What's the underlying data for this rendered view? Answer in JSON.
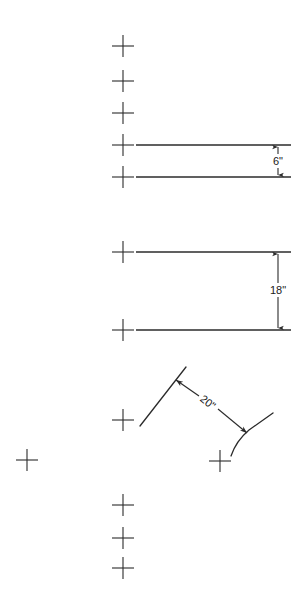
{
  "document": {
    "title": "Dimension Diagram",
    "background_color": "#ffffff",
    "line_color": "#2b2b2b",
    "text_color": "#1a1a1a",
    "width": 306,
    "height": 607
  },
  "dimensions": [
    {
      "id": "dim-6-inch",
      "label": "6\"",
      "value": 6,
      "unit": "inch",
      "orientation": "vertical",
      "between_lines": [
        "edge-line-1",
        "edge-line-2"
      ]
    },
    {
      "id": "dim-18-inch",
      "label": "18\"",
      "value": 18,
      "unit": "inch",
      "orientation": "vertical",
      "between_lines": [
        "edge-line-3",
        "edge-line-4"
      ]
    },
    {
      "id": "dim-20-inch",
      "label": "20\"",
      "value": 20,
      "unit": "inch",
      "orientation": "diagonal",
      "between_lines": [
        "angled-line-left",
        "angled-line-right"
      ]
    }
  ],
  "edge_lines": [
    {
      "id": "edge-line-1",
      "x1": 136,
      "y1": 145,
      "x2": 291,
      "y2": 145
    },
    {
      "id": "edge-line-2",
      "x1": 136,
      "y1": 177,
      "x2": 291,
      "y2": 177
    },
    {
      "id": "edge-line-3",
      "x1": 136,
      "y1": 252,
      "x2": 291,
      "y2": 252
    },
    {
      "id": "edge-line-4",
      "x1": 136,
      "y1": 330,
      "x2": 291,
      "y2": 330
    }
  ],
  "angled_lines": [
    {
      "id": "angled-line-left",
      "x1": 140,
      "y1": 426,
      "x2": 186,
      "y2": 367
    },
    {
      "id": "angled-line-right",
      "x1": 231,
      "y1": 456,
      "x2": 273,
      "y2": 413
    }
  ],
  "registration_marks": [
    {
      "id": "mark-1",
      "cx": 123,
      "cy": 46
    },
    {
      "id": "mark-2",
      "cx": 123,
      "cy": 81
    },
    {
      "id": "mark-3",
      "cx": 123,
      "cy": 113
    },
    {
      "id": "mark-4",
      "cx": 123,
      "cy": 145
    },
    {
      "id": "mark-5",
      "cx": 123,
      "cy": 177
    },
    {
      "id": "mark-6",
      "cx": 123,
      "cy": 252
    },
    {
      "id": "mark-7",
      "cx": 123,
      "cy": 330
    },
    {
      "id": "mark-8",
      "cx": 123,
      "cy": 420
    },
    {
      "id": "mark-9",
      "cx": 27,
      "cy": 460
    },
    {
      "id": "mark-10",
      "cx": 220,
      "cy": 461
    },
    {
      "id": "mark-11",
      "cx": 123,
      "cy": 505
    },
    {
      "id": "mark-12",
      "cx": 123,
      "cy": 538
    },
    {
      "id": "mark-13",
      "cx": 123,
      "cy": 568
    }
  ]
}
